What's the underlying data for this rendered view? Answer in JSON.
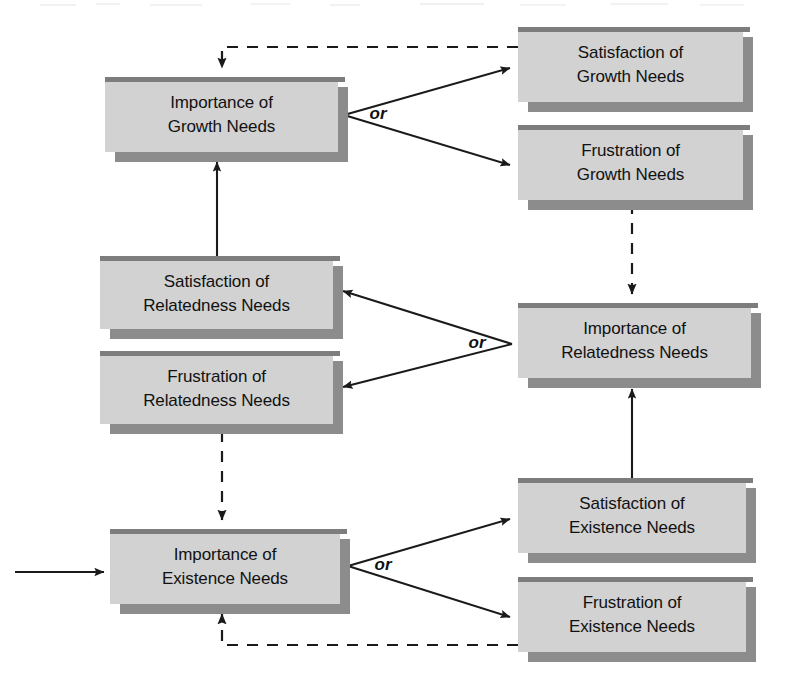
{
  "diagram": {
    "colors": {
      "box_fill": "#d2d2d2",
      "box_top_bar": "#808080",
      "box_shadow": "#8c8c8c",
      "line": "#1a1a1a",
      "text": "#111111",
      "background": "#ffffff"
    },
    "nodes": [
      {
        "id": "importance-growth",
        "line1": "Importance of",
        "line2": "Growth Needs",
        "x": 105,
        "y": 77,
        "w": 233,
        "h": 75
      },
      {
        "id": "satisfaction-growth",
        "line1": "Satisfaction of",
        "line2": "Growth Needs",
        "x": 518,
        "y": 27,
        "w": 225,
        "h": 75
      },
      {
        "id": "frustration-growth",
        "line1": "Frustration of",
        "line2": "Growth Needs",
        "x": 518,
        "y": 125,
        "w": 225,
        "h": 75
      },
      {
        "id": "satisfaction-relatedness",
        "line1": "Satisfaction of",
        "line2": "Relatedness Needs",
        "x": 100,
        "y": 256,
        "w": 233,
        "h": 73
      },
      {
        "id": "frustration-relatedness",
        "line1": "Frustration of",
        "line2": "Relatedness Needs",
        "x": 100,
        "y": 351,
        "w": 233,
        "h": 73
      },
      {
        "id": "importance-relatedness",
        "line1": "Importance of",
        "line2": "Relatedness Needs",
        "x": 518,
        "y": 303,
        "w": 233,
        "h": 75
      },
      {
        "id": "importance-existence",
        "line1": "Importance of",
        "line2": "Existence Needs",
        "x": 110,
        "y": 529,
        "w": 230,
        "h": 75
      },
      {
        "id": "satisfaction-existence",
        "line1": "Satisfaction of",
        "line2": "Existence Needs",
        "x": 518,
        "y": 478,
        "w": 228,
        "h": 75
      },
      {
        "id": "frustration-existence",
        "line1": "Frustration of",
        "line2": "Existence Needs",
        "x": 518,
        "y": 577,
        "w": 228,
        "h": 75
      }
    ],
    "or_labels": [
      {
        "id": "or-growth",
        "text": "or",
        "x": 378,
        "y": 115
      },
      {
        "id": "or-relatedness",
        "text": "or",
        "x": 477,
        "y": 344
      },
      {
        "id": "or-existence",
        "text": "or",
        "x": 383,
        "y": 566
      }
    ],
    "connections": [
      {
        "id": "entry-arrow",
        "style": "solid",
        "from": "external-left",
        "to": "importance-existence"
      },
      {
        "id": "growth-to-satisfaction",
        "style": "solid",
        "from": "importance-growth",
        "to": "satisfaction-growth"
      },
      {
        "id": "growth-to-frustration",
        "style": "solid",
        "from": "importance-growth",
        "to": "frustration-growth"
      },
      {
        "id": "satisfaction-growth-feedback",
        "style": "dashed",
        "from": "satisfaction-growth",
        "to": "importance-growth"
      },
      {
        "id": "frustration-growth-to-importance-relatedness",
        "style": "dashed",
        "from": "frustration-growth",
        "to": "importance-relatedness"
      },
      {
        "id": "relatedness-to-satisfaction",
        "style": "solid",
        "from": "importance-relatedness",
        "to": "satisfaction-relatedness"
      },
      {
        "id": "relatedness-to-frustration",
        "style": "solid",
        "from": "importance-relatedness",
        "to": "frustration-relatedness"
      },
      {
        "id": "satisfaction-relatedness-to-importance-growth",
        "style": "solid",
        "from": "satisfaction-relatedness",
        "to": "importance-growth"
      },
      {
        "id": "frustration-relatedness-to-importance-existence",
        "style": "dashed",
        "from": "frustration-relatedness",
        "to": "importance-existence"
      },
      {
        "id": "existence-to-satisfaction",
        "style": "solid",
        "from": "importance-existence",
        "to": "satisfaction-existence"
      },
      {
        "id": "existence-to-frustration",
        "style": "solid",
        "from": "importance-existence",
        "to": "frustration-existence"
      },
      {
        "id": "satisfaction-existence-to-importance-relatedness",
        "style": "solid",
        "from": "satisfaction-existence",
        "to": "importance-relatedness"
      },
      {
        "id": "frustration-existence-feedback",
        "style": "dashed",
        "from": "frustration-existence",
        "to": "importance-existence"
      }
    ]
  }
}
